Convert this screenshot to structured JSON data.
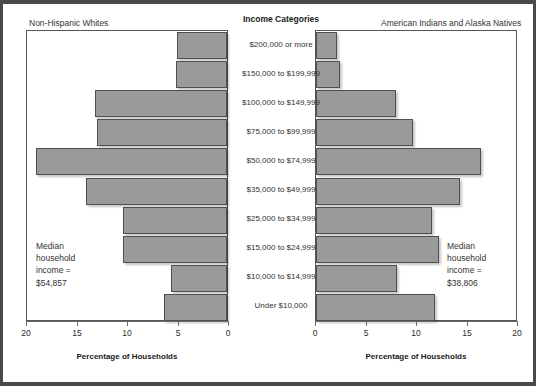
{
  "center_header": "Income Categories",
  "panels": {
    "left": {
      "title": "Non-Hispanic Whites",
      "axis_title": "Percentage of Households",
      "median_note": "Median\nhousehold\nincome =\n$54,857",
      "tick_labels": [
        "20",
        "15",
        "10",
        "5",
        "0"
      ]
    },
    "right": {
      "title": "American Indians and Alaska Natives",
      "axis_title": "Percentage of Households",
      "median_note": "Median\nhousehold\nincome =\n$38,806",
      "tick_labels": [
        "0",
        "5",
        "10",
        "15",
        "20"
      ]
    }
  },
  "chart_data": {
    "type": "bar",
    "title": "Income Categories",
    "subtitle": "Percentage of households by income category",
    "orientation": "horizontal",
    "layout": "population-pyramid",
    "xlabel": "Percentage of Households",
    "ylabel": "Income Categories",
    "xlim": [
      0,
      20
    ],
    "left_axis_direction": "reversed",
    "grid": false,
    "legend": "none",
    "bar_color": "#9a9a9a",
    "bar_edge_color": "#4f4f4f",
    "categories": [
      "$200,000 or more",
      "$150,000 to $199,999",
      "$100,000 to $149,999",
      "$75,000 to $99,999",
      "$50,000 to $74,999",
      "$35,000 to $49,999",
      "$25,000 to $34,999",
      "$15,000 to $24,999",
      "$10,000 to $14,999",
      "Under $10,000"
    ],
    "series": [
      {
        "name": "Non-Hispanic Whites",
        "side": "left",
        "median_household_income": "$54,857",
        "values": [
          5.0,
          5.1,
          13.1,
          12.9,
          18.9,
          14.0,
          10.3,
          10.3,
          5.5,
          6.2
        ]
      },
      {
        "name": "American Indians and Alaska Natives",
        "side": "right",
        "median_household_income": "$38,806",
        "values": [
          2.1,
          2.4,
          7.9,
          9.6,
          16.3,
          14.3,
          11.5,
          12.2,
          8.0,
          11.8
        ]
      }
    ],
    "ticks": [
      0,
      5,
      10,
      15,
      20
    ]
  }
}
